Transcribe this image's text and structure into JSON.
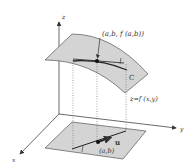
{
  "diagram": {
    "labels": {
      "z_axis": "z",
      "y_axis": "y",
      "x_axis": "x",
      "point_on_surface": "(a,b, f (a,b))",
      "curve": "C",
      "surface_eq": "z=f (x,y)",
      "base_point": "(a,b)",
      "direction_vector": "u"
    },
    "colors": {
      "surface_fill": "#d4d4d4",
      "stroke": "#333333",
      "dotted": "#666666",
      "background": "#ffffff"
    }
  }
}
